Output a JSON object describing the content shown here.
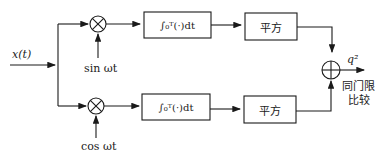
{
  "diagram": {
    "type": "block-diagram",
    "title": "",
    "input": {
      "label": "x(t)"
    },
    "branches": [
      {
        "name": "in-phase",
        "multiplier": {
          "symbol": "⊗",
          "reference": "sin ωt"
        },
        "integrator": {
          "label": "∫₀ᵀ(·)dt"
        },
        "square": {
          "label": "平方"
        }
      },
      {
        "name": "quadrature",
        "multiplier": {
          "symbol": "⊗",
          "reference": "cos ωt"
        },
        "integrator": {
          "label": "∫₀ᵀ(·)dt"
        },
        "square": {
          "label": "平方"
        }
      }
    ],
    "summer": {
      "symbol": "⊕"
    },
    "output": {
      "label": "q²",
      "note_line1": "同门限",
      "note_line2": "比较"
    },
    "colors": {
      "line": "#1a1a1a",
      "background": "#ffffff"
    }
  }
}
